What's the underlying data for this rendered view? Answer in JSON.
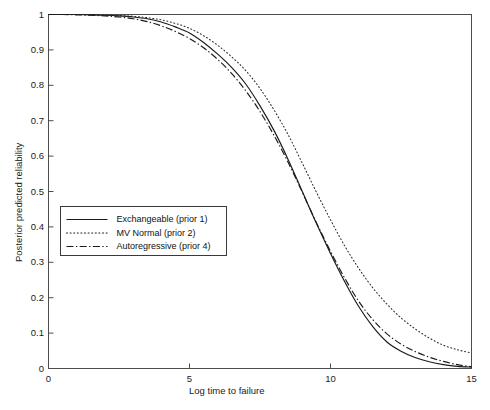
{
  "figure": {
    "background": "#ffffff",
    "axes_color": "#4d4d4d",
    "line_color": "#1a1a1a"
  },
  "chart_data": {
    "type": "line",
    "title": "",
    "xlabel": "Log time to failure",
    "ylabel": "Posterior predicted reliability",
    "xlim": [
      0,
      15
    ],
    "ylim": [
      0,
      1
    ],
    "xticks": [
      0,
      5,
      10,
      15
    ],
    "xtick_labels": [
      "0",
      "5",
      "10",
      "15"
    ],
    "yticks": [
      0,
      0.1,
      0.2,
      0.3,
      0.4,
      0.5,
      0.6,
      0.7,
      0.8,
      0.9,
      1
    ],
    "ytick_labels": [
      "0",
      "0.1",
      "0.2",
      "0.3",
      "0.4",
      "0.5",
      "0.6",
      "0.7",
      "0.8",
      "0.9",
      "1"
    ],
    "grid": false,
    "legend_position": "center-left",
    "x": [
      0,
      0.5,
      1,
      1.5,
      2,
      2.5,
      3,
      3.5,
      4,
      4.5,
      5,
      5.5,
      6,
      6.5,
      7,
      7.5,
      8,
      8.5,
      9,
      9.5,
      10,
      10.5,
      11,
      11.5,
      12,
      12.5,
      13,
      13.5,
      14,
      14.5,
      15
    ],
    "series": [
      {
        "name": "Exchangeable (prior 1)",
        "linestyle": "solid",
        "color": "#1a1a1a",
        "values": [
          1.0,
          1.0,
          1.0,
          0.999,
          0.998,
          0.996,
          0.993,
          0.988,
          0.979,
          0.965,
          0.948,
          0.921,
          0.888,
          0.85,
          0.803,
          0.742,
          0.672,
          0.59,
          0.5,
          0.41,
          0.325,
          0.246,
          0.175,
          0.118,
          0.075,
          0.049,
          0.031,
          0.019,
          0.011,
          0.006,
          0.004
        ]
      },
      {
        "name": "MV Normal (prior 2)",
        "linestyle": "dotted",
        "color": "#2a2a2a",
        "values": [
          1.0,
          1.0,
          1.0,
          0.999,
          0.998,
          0.997,
          0.995,
          0.991,
          0.985,
          0.975,
          0.961,
          0.94,
          0.913,
          0.88,
          0.841,
          0.791,
          0.73,
          0.66,
          0.58,
          0.498,
          0.42,
          0.347,
          0.283,
          0.228,
          0.182,
          0.143,
          0.112,
          0.086,
          0.066,
          0.053,
          0.044
        ]
      },
      {
        "name": "Autoregressive (prior 4)",
        "linestyle": "dashdot",
        "color": "#1a1a1a",
        "values": [
          1.0,
          1.0,
          0.999,
          0.998,
          0.996,
          0.993,
          0.988,
          0.98,
          0.968,
          0.952,
          0.932,
          0.906,
          0.873,
          0.833,
          0.784,
          0.726,
          0.658,
          0.582,
          0.498,
          0.412,
          0.331,
          0.256,
          0.19,
          0.138,
          0.098,
          0.069,
          0.048,
          0.032,
          0.02,
          0.011,
          0.005
        ]
      }
    ]
  },
  "legend": {
    "items": [
      {
        "label": "Exchangeable (prior 1)",
        "style": "solid"
      },
      {
        "label": "MV Normal (prior 2)",
        "style": "dotted"
      },
      {
        "label": "Autoregressive (prior 4)",
        "style": "dashdot"
      }
    ]
  }
}
